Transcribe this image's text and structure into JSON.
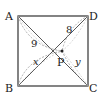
{
  "diagram": {
    "type": "geometry",
    "shape": "square",
    "vertices": {
      "A": "A",
      "B": "B",
      "C": "C",
      "D": "D"
    },
    "point": "P",
    "segments": {
      "PA": "9",
      "PD": "8",
      "PB": "x",
      "PC": "y"
    },
    "colors": {
      "stroke": "#333333",
      "dashed": "#999999"
    }
  }
}
